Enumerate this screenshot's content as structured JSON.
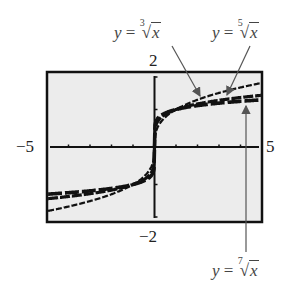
{
  "chart_data": {
    "type": "line",
    "title": "",
    "xlabel": "",
    "ylabel": "",
    "xlim": [
      -5,
      5
    ],
    "ylim": [
      -2,
      2
    ],
    "x_tick_step": 1,
    "y_tick_step": 1,
    "grid": false,
    "legend_position": "annotations",
    "window_labels": {
      "xmin": "−5",
      "xmax": "5",
      "ymin": "−2",
      "ymax": "2"
    },
    "x": [
      -5,
      -4,
      -3,
      -2,
      -1,
      -0.5,
      -0.1,
      0,
      0.1,
      0.5,
      1,
      2,
      3,
      4,
      5
    ],
    "series": [
      {
        "name": "y = ∛x",
        "root": 3,
        "values": [
          -1.71,
          -1.59,
          -1.44,
          -1.26,
          -1.0,
          -0.79,
          -0.46,
          0,
          0.46,
          0.79,
          1.0,
          1.26,
          1.44,
          1.59,
          1.71
        ]
      },
      {
        "name": "y = ⁵√x",
        "root": 5,
        "values": [
          -1.38,
          -1.32,
          -1.25,
          -1.15,
          -1.0,
          -0.87,
          -0.63,
          0,
          0.63,
          0.87,
          1.0,
          1.15,
          1.25,
          1.32,
          1.38
        ]
      },
      {
        "name": "y = ⁷√x",
        "root": 7,
        "values": [
          -1.26,
          -1.22,
          -1.17,
          -1.1,
          -1.0,
          -0.91,
          -0.72,
          0,
          0.72,
          0.91,
          1.0,
          1.1,
          1.17,
          1.22,
          1.26
        ]
      }
    ],
    "annotations": [
      {
        "text": "y = ∛x",
        "index": "3",
        "points_to": "upper curve near x≈2.3"
      },
      {
        "text": "y = ⁵√x",
        "index": "5",
        "points_to": "middle curve near x≈3.5"
      },
      {
        "text": "y = ⁷√x",
        "index": "7",
        "points_to": "lower curve near x≈4.4"
      }
    ]
  },
  "labels": {
    "ymax": "2",
    "ymin": "−2",
    "xmin": "−5",
    "xmax": "5",
    "cube": {
      "y": "y",
      "eq": " = ",
      "idx": "3",
      "sym": "√",
      "arg": "x"
    },
    "fifth": {
      "y": "y",
      "eq": " = ",
      "idx": "5",
      "sym": "√",
      "arg": "x"
    },
    "seventh": {
      "y": "y",
      "eq": " = ",
      "idx": "7",
      "sym": "√",
      "arg": "x"
    }
  }
}
